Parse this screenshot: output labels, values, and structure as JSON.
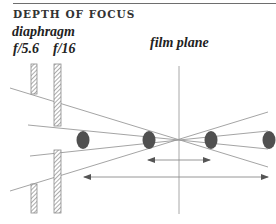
{
  "header": {
    "title": "DEPTH OF FOCUS"
  },
  "labels": {
    "diaphragm": "diaphragm",
    "fstop_wide": "f/5.6",
    "fstop_narrow": "f/16",
    "film_plane": "film plane"
  },
  "colors": {
    "line": "#9a9a9a",
    "ellipse": "#505050",
    "rule": "#6e6e6e",
    "text": "#222222"
  },
  "diagram": {
    "apertures": [
      {
        "label": "f/5.6",
        "x": 31,
        "segments": [
          [
            64,
            94
          ],
          [
            184,
            213
          ]
        ]
      },
      {
        "label": "f/16",
        "x": 54,
        "segments": [
          [
            64,
            126
          ],
          [
            150,
            213
          ]
        ]
      }
    ],
    "film_plane_x": 179,
    "focus_point": [
      179,
      140
    ],
    "ellipses_x": [
      83,
      149,
      211,
      269
    ],
    "arrows": [
      {
        "name": "narrow-depth",
        "y": 160,
        "x1": 148,
        "x2": 210
      },
      {
        "name": "wide-depth",
        "y": 177,
        "x1": 84,
        "x2": 268
      }
    ]
  }
}
